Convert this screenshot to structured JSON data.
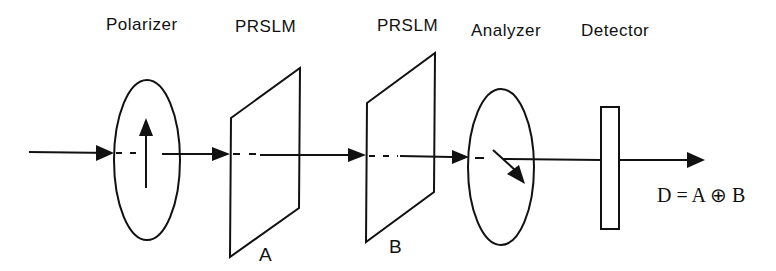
{
  "diagram": {
    "components": [
      {
        "id": "polarizer",
        "label": "Polarizer"
      },
      {
        "id": "prslm-a",
        "label": "PRSLM",
        "sublabel": "A"
      },
      {
        "id": "prslm-b",
        "label": "PRSLM",
        "sublabel": "B"
      },
      {
        "id": "analyzer",
        "label": "Analyzer"
      },
      {
        "id": "detector",
        "label": "Detector"
      }
    ],
    "output_equation": "D = A ⊕ B",
    "stroke_color": "#111111",
    "background": "#ffffff"
  }
}
